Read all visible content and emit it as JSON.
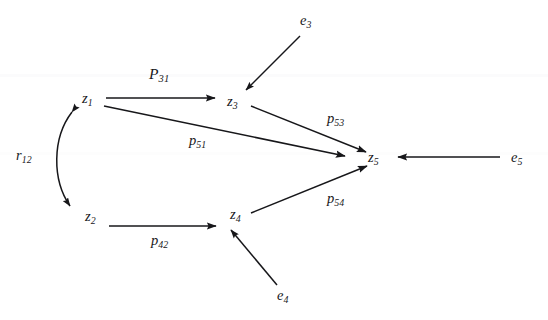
{
  "figure": {
    "type": "path-diagram",
    "background_color": "#ffffff",
    "ink_color": "#17171a"
  },
  "nodes": [
    {
      "id": "z1",
      "label": "z",
      "subscript": "1",
      "x": 88,
      "y": 98
    },
    {
      "id": "z2",
      "label": "z",
      "subscript": "2",
      "x": 91,
      "y": 216
    },
    {
      "id": "z3",
      "label": "z",
      "subscript": "3",
      "x": 233,
      "y": 101
    },
    {
      "id": "z4",
      "label": "z",
      "subscript": "4",
      "x": 236,
      "y": 214
    },
    {
      "id": "z5",
      "label": "z",
      "subscript": "5",
      "x": 374,
      "y": 157
    }
  ],
  "errors": [
    {
      "id": "e3",
      "label": "e",
      "subscript": "3",
      "x": 306,
      "y": 20
    },
    {
      "id": "e4",
      "label": "e",
      "subscript": "4",
      "x": 283,
      "y": 295
    },
    {
      "id": "e5",
      "label": "e",
      "subscript": "5",
      "x": 517,
      "y": 157
    }
  ],
  "paths": [
    {
      "id": "p31",
      "label": "P",
      "subscript": "31",
      "capital": true,
      "from": "z1",
      "to": "z3",
      "x": 158,
      "y": 75
    },
    {
      "id": "p51",
      "label": "p",
      "subscript": "51",
      "capital": false,
      "from": "z1",
      "to": "z5",
      "x": 196,
      "y": 141
    },
    {
      "id": "p53",
      "label": "p",
      "subscript": "53",
      "capital": false,
      "from": "z3",
      "to": "z5",
      "x": 334,
      "y": 119
    },
    {
      "id": "p54",
      "label": "p",
      "subscript": "54",
      "capital": false,
      "from": "z4",
      "to": "z5",
      "x": 334,
      "y": 199
    },
    {
      "id": "p42",
      "label": "p",
      "subscript": "42",
      "capital": false,
      "from": "z2",
      "to": "z4",
      "x": 158,
      "y": 241
    }
  ],
  "correlations": [
    {
      "id": "r12",
      "label": "r",
      "subscript": "12",
      "between": [
        "z1",
        "z2"
      ],
      "x": 22,
      "y": 155
    }
  ],
  "error_paths": [
    {
      "id": "e3-z3",
      "from": "e3",
      "to": "z3"
    },
    {
      "id": "e4-z4",
      "from": "e4",
      "to": "z4"
    },
    {
      "id": "e5-z5",
      "from": "e5",
      "to": "z5"
    }
  ]
}
